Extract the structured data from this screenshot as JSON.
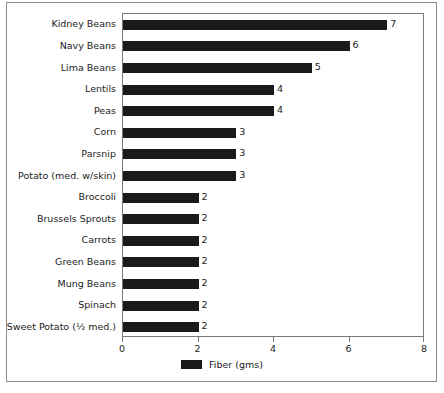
{
  "chart_data": {
    "type": "bar",
    "orientation": "horizontal",
    "title": "",
    "xlabel": "",
    "ylabel": "",
    "xlim": [
      0,
      8
    ],
    "xticks": [
      0,
      2,
      4,
      6,
      8
    ],
    "grid": false,
    "legend": {
      "position": "bottom",
      "entries": [
        {
          "name": "Fiber (gms)",
          "color": "#1a1a1a"
        }
      ]
    },
    "series": [
      {
        "name": "Fiber (gms)",
        "color": "#1a1a1a",
        "values": [
          7,
          6,
          5,
          4,
          4,
          3,
          3,
          3,
          2,
          2,
          2,
          2,
          2,
          2,
          2
        ]
      }
    ],
    "categories": [
      "Kidney Beans",
      "Navy Beans",
      "Lima Beans",
      "Lentils",
      "Peas",
      "Corn",
      "Parsnip",
      "Potato (med. w/skin)",
      "Broccoli",
      "Brussels Sprouts",
      "Carrots",
      "Green Beans",
      "Mung Beans",
      "Spinach",
      "Sweet Potato (½ med.)"
    ],
    "data_labels": [
      "7",
      "6",
      "5",
      "4",
      "4",
      "3",
      "3",
      "3",
      "2",
      "2",
      "2",
      "2",
      "2",
      "2",
      "2"
    ],
    "xtick_labels": [
      "0",
      "2",
      "4",
      "6",
      "8"
    ]
  },
  "colors": {
    "bar": "#1a1a1a",
    "text": "#1c1c1c",
    "axis": "#7a7a7a",
    "frame": "#8c8c8c",
    "plot_background": "#ffffff"
  }
}
